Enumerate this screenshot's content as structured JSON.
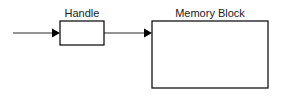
{
  "diagram": {
    "background_color": "#ffffff",
    "line_color": "#2b2b2b",
    "box_stroke_color": "#000000",
    "text_color": "#1a1a1a",
    "nodes": [
      {
        "id": "handle",
        "label": "Handle",
        "label_x": 82,
        "label_y": 17,
        "x": 60,
        "y": 21,
        "width": 44,
        "height": 24
      },
      {
        "id": "memory_block",
        "label": "Memory Block",
        "label_x": 210,
        "label_y": 17,
        "x": 152,
        "y": 21,
        "width": 116,
        "height": 67
      }
    ],
    "edges": [
      {
        "id": "incoming-arrow",
        "label": "",
        "from": "",
        "to": "handle",
        "x1": 13,
        "y1": 33,
        "x2": 60,
        "y2": 33,
        "arrowhead": "solid-triangle"
      },
      {
        "id": "handle-to-memory-arrow",
        "label": "",
        "from": "handle",
        "to": "memory_block",
        "x1": 82,
        "y1": 33,
        "x2": 152,
        "y2": 33,
        "arrowhead": "solid-triangle"
      }
    ]
  }
}
